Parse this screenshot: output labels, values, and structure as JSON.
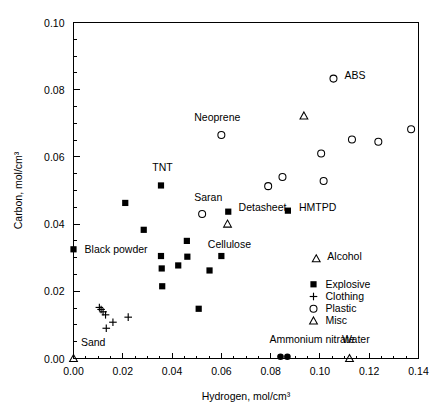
{
  "chart_data": {
    "type": "scatter",
    "title": "",
    "xlabel": "Hydrogen, mol/cm³",
    "ylabel": "Carbon, mol/cm³",
    "xlim": [
      0.0,
      0.14
    ],
    "ylim": [
      0.0,
      0.1
    ],
    "xticks": [
      "0.00",
      "0.02",
      "0.04",
      "0.06",
      "0.08",
      "0.10",
      "0.12",
      "0.14"
    ],
    "xtick_values": [
      0.0,
      0.02,
      0.04,
      0.06,
      0.08,
      0.1,
      0.12,
      0.14
    ],
    "yticks": [
      "0.00",
      "0.02",
      "0.04",
      "0.06",
      "0.08",
      "0.10"
    ],
    "ytick_values": [
      0.0,
      0.02,
      0.04,
      0.06,
      0.08,
      0.1
    ],
    "minor_ticks": true,
    "grid": false,
    "legend_position": "lower right",
    "legend": [
      {
        "label": "Explosive",
        "marker": "filled-square"
      },
      {
        "label": "Clothing",
        "marker": "plus"
      },
      {
        "label": "Plastic",
        "marker": "open-circle"
      },
      {
        "label": "Misc",
        "marker": "open-triangle"
      }
    ],
    "series": [
      {
        "name": "Explosive",
        "marker": "filled-square",
        "points": [
          {
            "x": 0.0,
            "y": 0.0325,
            "label": "Black powder",
            "label_pos": "right"
          },
          {
            "x": 0.021,
            "y": 0.0463,
            "label": "",
            "label_pos": ""
          },
          {
            "x": 0.0285,
            "y": 0.0383,
            "label": "",
            "label_pos": ""
          },
          {
            "x": 0.0355,
            "y": 0.0515,
            "label": "TNT",
            "label_pos": "above"
          },
          {
            "x": 0.0355,
            "y": 0.0305,
            "label": "",
            "label_pos": ""
          },
          {
            "x": 0.0358,
            "y": 0.0268,
            "label": "",
            "label_pos": ""
          },
          {
            "x": 0.036,
            "y": 0.0215,
            "label": "",
            "label_pos": ""
          },
          {
            "x": 0.0425,
            "y": 0.0277,
            "label": "",
            "label_pos": ""
          },
          {
            "x": 0.046,
            "y": 0.035,
            "label": "",
            "label_pos": ""
          },
          {
            "x": 0.0462,
            "y": 0.0303,
            "label": "",
            "label_pos": ""
          },
          {
            "x": 0.0508,
            "y": 0.0148,
            "label": "",
            "label_pos": ""
          },
          {
            "x": 0.0552,
            "y": 0.0262,
            "label": "",
            "label_pos": ""
          },
          {
            "x": 0.06,
            "y": 0.0305,
            "label": "",
            "label_pos": ""
          },
          {
            "x": 0.0628,
            "y": 0.0437,
            "label": "Detasheet",
            "label_pos": "right"
          },
          {
            "x": 0.087,
            "y": 0.044,
            "label": "HMTPD",
            "label_pos": "right"
          },
          {
            "x": 0.084,
            "y": 0.0005,
            "label": "Ammonium nitrate",
            "label_pos": "above"
          },
          {
            "x": 0.0868,
            "y": 0.0005,
            "label": "",
            "label_pos": ""
          }
        ]
      },
      {
        "name": "Clothing",
        "marker": "plus",
        "points": [
          {
            "x": 0.0105,
            "y": 0.0152,
            "label": "",
            "label_pos": ""
          },
          {
            "x": 0.0112,
            "y": 0.0146,
            "label": "",
            "label_pos": ""
          },
          {
            "x": 0.012,
            "y": 0.0139,
            "label": "",
            "label_pos": ""
          },
          {
            "x": 0.013,
            "y": 0.013,
            "label": "",
            "label_pos": ""
          },
          {
            "x": 0.0133,
            "y": 0.009,
            "label": "",
            "label_pos": ""
          },
          {
            "x": 0.016,
            "y": 0.0108,
            "label": "",
            "label_pos": ""
          },
          {
            "x": 0.0222,
            "y": 0.0123,
            "label": "",
            "label_pos": ""
          }
        ]
      },
      {
        "name": "Plastic",
        "marker": "open-circle",
        "points": [
          {
            "x": 0.0522,
            "y": 0.043,
            "label": "Saran",
            "label_pos": "above"
          },
          {
            "x": 0.06,
            "y": 0.0665,
            "label": "Neoprene",
            "label_pos": "above"
          },
          {
            "x": 0.079,
            "y": 0.0513,
            "label": "",
            "label_pos": ""
          },
          {
            "x": 0.0848,
            "y": 0.054,
            "label": "",
            "label_pos": ""
          },
          {
            "x": 0.1055,
            "y": 0.0833,
            "label": "ABS",
            "label_pos": "right"
          },
          {
            "x": 0.1005,
            "y": 0.061,
            "label": "",
            "label_pos": ""
          },
          {
            "x": 0.1015,
            "y": 0.0528,
            "label": "",
            "label_pos": ""
          },
          {
            "x": 0.113,
            "y": 0.0652,
            "label": "",
            "label_pos": ""
          },
          {
            "x": 0.1237,
            "y": 0.0645,
            "label": "",
            "label_pos": ""
          },
          {
            "x": 0.137,
            "y": 0.0682,
            "label": "",
            "label_pos": ""
          }
        ]
      },
      {
        "name": "Misc",
        "marker": "open-triangle",
        "points": [
          {
            "x": 0.0,
            "y": 0.0,
            "label": "Sand",
            "label_pos": "above-right"
          },
          {
            "x": 0.0625,
            "y": 0.04,
            "label": "Cellulose",
            "label_pos": "below"
          },
          {
            "x": 0.0935,
            "y": 0.0722,
            "label": "",
            "label_pos": ""
          },
          {
            "x": 0.0985,
            "y": 0.0297,
            "label": "Alcohol",
            "label_pos": "right"
          },
          {
            "x": 0.112,
            "y": 0.0,
            "label": "Water",
            "label_pos": "above"
          }
        ]
      }
    ],
    "annotations": [
      {
        "text": "Black powder",
        "x": 0.0045,
        "y": 0.0325
      },
      {
        "text": "TNT",
        "x": 0.032,
        "y": 0.057
      },
      {
        "text": "Saran",
        "x": 0.049,
        "y": 0.048
      },
      {
        "text": "Neoprene",
        "x": 0.049,
        "y": 0.072
      },
      {
        "text": "Detasheet",
        "x": 0.067,
        "y": 0.045
      },
      {
        "text": "Cellulose",
        "x": 0.0545,
        "y": 0.034
      },
      {
        "text": "HMTPD",
        "x": 0.0915,
        "y": 0.0452
      },
      {
        "text": "ABS",
        "x": 0.11,
        "y": 0.0845
      },
      {
        "text": "Alcohol",
        "x": 0.103,
        "y": 0.0305
      },
      {
        "text": "Ammonium nitrate",
        "x": 0.0795,
        "y": 0.0058
      },
      {
        "text": "Water",
        "x": 0.109,
        "y": 0.0058
      },
      {
        "text": "Sand",
        "x": 0.003,
        "y": 0.0048
      }
    ]
  }
}
